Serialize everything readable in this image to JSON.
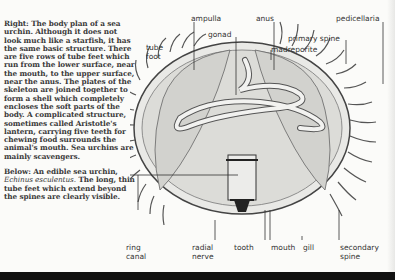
{
  "caption": {
    "right_heading": "Right:",
    "right_text": "The body plan of a sea urchin. Although it does not look much like a starfish, it has the same basic structure. There are five rows of tube feet which run from the lower surface, near the mouth, to the upper surface, near the anus. The plates of the skeleton are joined together to form a shell which completely encloses the soft parts of the body. A complicated structure, sometimes called Aristotle's lantern, carrying five teeth for chewing food surrounds the animal's mouth. Sea urchins are mainly scavengers.",
    "below_heading": "Below:",
    "below_text_1": "An edible sea urchin,",
    "below_species": "Echinus esculentus.",
    "below_text_2": "The long, thin tube feet which extend beyond the spines are clearly visible."
  },
  "labels": {
    "ampulla": "ampulla",
    "anus": "anus",
    "pedicellaria": "pedicellaria",
    "tube_foot": "tube\nfoot",
    "gonad": "gonad",
    "primary_spine": "primary spine",
    "madreporite": "madreporite",
    "ring_canal": "ring\ncanal",
    "radial_nerve": "radial\nnerve",
    "tooth": "tooth",
    "mouth": "mouth",
    "gill": "gill",
    "secondary_spine": "secondary\nspine"
  }
}
